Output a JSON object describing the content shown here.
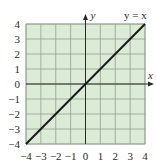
{
  "chart_data": {
    "type": "line",
    "title": "",
    "xlabel": "x",
    "ylabel": "y",
    "xlim": [
      -4,
      4
    ],
    "ylim": [
      -4,
      4
    ],
    "grid": true,
    "x_ticks": [
      -4,
      -3,
      -2,
      -1,
      0,
      1,
      2,
      3,
      4
    ],
    "y_ticks": [
      -4,
      -3,
      -2,
      -1,
      0,
      1,
      2,
      3,
      4
    ],
    "x_tick_labels": [
      "−4",
      "−3",
      "−2",
      "−1",
      "0",
      "1",
      "2",
      "3",
      "4"
    ],
    "y_tick_labels": [
      "−4",
      "−3",
      "−2",
      "−1",
      "0",
      "1",
      "2",
      "3",
      "4"
    ],
    "series": [
      {
        "name": "y = x",
        "x": [
          -4,
          -3,
          -2,
          -1,
          0,
          1,
          2,
          3,
          4
        ],
        "y": [
          -4,
          -3,
          -2,
          -1,
          0,
          1,
          2,
          3,
          4
        ]
      }
    ],
    "annotations": [
      {
        "text": "y = x",
        "x": 3.2,
        "y": 4.5
      }
    ],
    "colors": {
      "plot_fill": "#dcebd6",
      "grid_line": "#8fa08f",
      "axis": "#2a2a2a",
      "series": "#1a1a1a"
    }
  }
}
